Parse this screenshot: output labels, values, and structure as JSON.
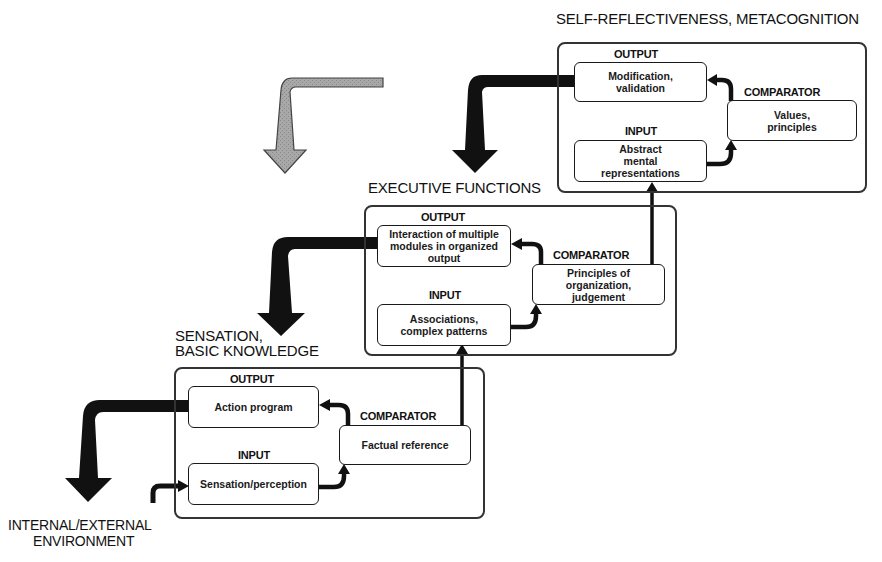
{
  "diagram": {
    "type": "hierarchical feedback-loop diagram",
    "levels": [
      {
        "id": "metacognition",
        "title": "SELF-REFLECTIVENESS, METACOGNITION",
        "output_label": "OUTPUT",
        "output_text": "Modification,\nvalidation",
        "input_label": "INPUT",
        "input_text": "Abstract\nmental\nrepresentations",
        "comparator_label": "COMPARATOR",
        "comparator_text": "Values,\nprinciples"
      },
      {
        "id": "executive",
        "title": "EXECUTIVE FUNCTIONS",
        "output_label": "OUTPUT",
        "output_text": "Interaction of multiple\nmodules in organized\noutput",
        "input_label": "INPUT",
        "input_text": "Associations,\ncomplex patterns",
        "comparator_label": "COMPARATOR",
        "comparator_text": "Principles of\norganization,\njudgement"
      },
      {
        "id": "sensation",
        "title_line1": "SENSATION,",
        "title_line2": "BASIC KNOWLEDGE",
        "output_label": "OUTPUT",
        "output_text": "Action program",
        "input_label": "INPUT",
        "input_text": "Sensation/perception",
        "comparator_label": "COMPARATOR",
        "comparator_text": "Factual reference"
      }
    ],
    "environment": {
      "line1": "INTERNAL/EXTERNAL",
      "line2": "ENVIRONMENT"
    },
    "arrows": {
      "output_arrow_color": "#111111",
      "topdown_arrow_color": "#9a9a9a",
      "feedback_arrows": "black bent arrows from each OUTPUT box down to the level below",
      "gray_arrow": "gray bent arrow at top-left entering from above"
    }
  }
}
